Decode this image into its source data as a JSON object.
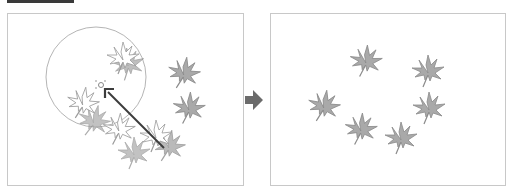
{
  "figure": {
    "header_bar": "",
    "colors": {
      "leaf_fill": "#a9a9a9",
      "leaf_stroke": "#8a8a8a",
      "outline_leaf_stroke": "#9a9a9a",
      "circle_stroke": "#b5b5b5",
      "arrow": "#3c3c3c",
      "transition_arrow": "#6b6b6b",
      "panel_border": "#c8c8c8"
    },
    "before_panel": {
      "label": "before",
      "brush_circle": {
        "cx": 88,
        "cy": 63,
        "r": 50
      },
      "center_marker": {
        "x": 93,
        "y": 71
      },
      "drag_arrow": {
        "from": [
          156,
          134
        ],
        "to": [
          97,
          75
        ]
      },
      "solid_leaves": [
        {
          "x": 176,
          "y": 59,
          "rot": 10
        },
        {
          "x": 181,
          "y": 94,
          "rot": 5
        },
        {
          "x": 120,
          "y": 50,
          "rot": -5,
          "opacity": 0.75
        },
        {
          "x": 86,
          "y": 107,
          "rot": 15,
          "opacity": 0.7
        },
        {
          "x": 126,
          "y": 139,
          "rot": 0,
          "opacity": 0.7
        },
        {
          "x": 161,
          "y": 132,
          "rot": 10,
          "opacity": 0.8
        }
      ],
      "outline_leaves": [
        {
          "x": 115,
          "y": 44,
          "rot": 0
        },
        {
          "x": 75,
          "y": 89,
          "rot": 10
        },
        {
          "x": 111,
          "y": 115,
          "rot": 5
        },
        {
          "x": 148,
          "y": 122,
          "rot": 0
        }
      ]
    },
    "after_panel": {
      "label": "after",
      "leaves": [
        {
          "x": 95,
          "y": 47,
          "rot": 5
        },
        {
          "x": 157,
          "y": 57,
          "rot": 0
        },
        {
          "x": 53,
          "y": 92,
          "rot": 10
        },
        {
          "x": 158,
          "y": 94,
          "rot": 0
        },
        {
          "x": 90,
          "y": 115,
          "rot": 5
        },
        {
          "x": 130,
          "y": 124,
          "rot": 0
        }
      ]
    },
    "transition": {
      "icon": "right-arrow-icon"
    }
  }
}
